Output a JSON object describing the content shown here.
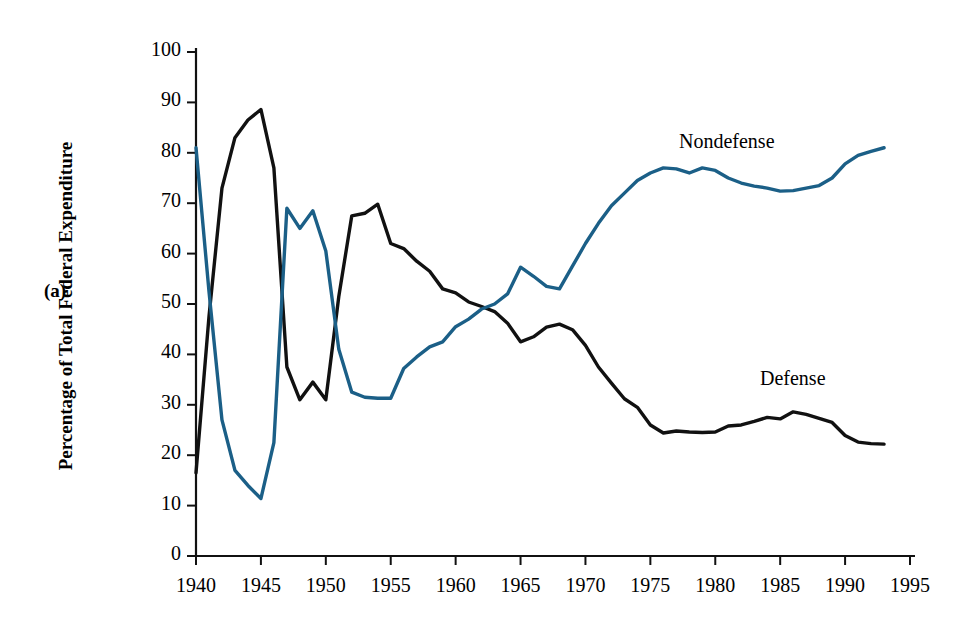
{
  "figure": {
    "panel_label": "(a)",
    "y_axis_title": "Percentage of Total Federal Expenditure"
  },
  "chart_data": {
    "type": "line",
    "title": "",
    "xlabel": "",
    "ylabel": "Percentage of Total Federal Expenditure",
    "xlim": [
      1940,
      1995
    ],
    "ylim": [
      0,
      100
    ],
    "grid": false,
    "legend_position": "inline-annotations",
    "x_ticks": [
      "1940",
      "1945",
      "1950",
      "1955",
      "1960",
      "1965",
      "1970",
      "1975",
      "1980",
      "1985",
      "1990",
      "1995"
    ],
    "y_ticks": [
      "0",
      "10",
      "20",
      "30",
      "40",
      "50",
      "60",
      "70",
      "80",
      "90",
      "100"
    ],
    "x": [
      1940,
      1941,
      1942,
      1943,
      1944,
      1945,
      1946,
      1947,
      1948,
      1949,
      1950,
      1951,
      1952,
      1953,
      1954,
      1955,
      1956,
      1957,
      1958,
      1959,
      1960,
      1961,
      1962,
      1963,
      1964,
      1965,
      1966,
      1967,
      1968,
      1969,
      1970,
      1971,
      1972,
      1973,
      1974,
      1975,
      1976,
      1977,
      1978,
      1979,
      1980,
      1981,
      1982,
      1983,
      1984,
      1985,
      1986,
      1987,
      1988,
      1989,
      1990,
      1991,
      1992,
      1993
    ],
    "series": [
      {
        "name": "Defense",
        "color": "#111111",
        "values": [
          16.5,
          47.5,
          73.0,
          83.0,
          86.5,
          88.6,
          77.0,
          37.5,
          31.0,
          34.5,
          31.0,
          51.5,
          67.5,
          68.0,
          69.8,
          62.0,
          61.0,
          58.5,
          56.5,
          53.0,
          52.2,
          50.4,
          49.5,
          48.5,
          46.2,
          42.5,
          43.5,
          45.4,
          46.0,
          44.9,
          41.8,
          37.5,
          34.3,
          31.2,
          29.5,
          26.0,
          24.4,
          24.8,
          24.6,
          24.5,
          24.6,
          25.8,
          26.0,
          26.7,
          27.5,
          27.2,
          28.6,
          28.1,
          27.3,
          26.5,
          23.9,
          22.6,
          22.3,
          22.2
        ]
      },
      {
        "name": "Nondefense",
        "color": "#1b5f87",
        "values": [
          81.0,
          52.5,
          27.0,
          17.0,
          14.0,
          11.4,
          22.5,
          69.0,
          65.0,
          68.5,
          60.5,
          41.0,
          32.5,
          31.5,
          31.3,
          31.3,
          37.2,
          39.5,
          41.5,
          42.5,
          45.5,
          47.0,
          49.0,
          50.0,
          52.0,
          57.3,
          55.5,
          53.5,
          53.0,
          57.5,
          62.0,
          66.0,
          69.5,
          72.0,
          74.5,
          76.0,
          77.0,
          76.8,
          76.0,
          77.0,
          76.5,
          75.0,
          74.0,
          73.4,
          73.0,
          72.4,
          72.5,
          73.0,
          73.5,
          75.0,
          77.8,
          79.5,
          80.3,
          81.0
        ]
      }
    ]
  }
}
